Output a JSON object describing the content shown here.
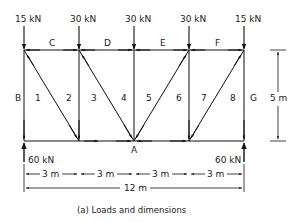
{
  "diagram": {
    "type": "truss-loads-and-dimensions",
    "caption": "(a) Loads and dimensions",
    "applied_loads": [
      {
        "label": "15 kN",
        "position_m": 0
      },
      {
        "label": "30 kN",
        "position_m": 3
      },
      {
        "label": "30 kN",
        "position_m": 6
      },
      {
        "label": "30 kN",
        "position_m": 9
      },
      {
        "label": "15 kN",
        "position_m": 12
      }
    ],
    "reactions": [
      {
        "label": "60 kN",
        "side": "left"
      },
      {
        "label": "60 kN",
        "side": "right"
      }
    ],
    "space_labels": {
      "top": [
        "C",
        "D",
        "E",
        "F"
      ],
      "left": "B",
      "right": "G",
      "bottom": "A",
      "interior": [
        "1",
        "2",
        "3",
        "4",
        "5",
        "6",
        "7",
        "8"
      ]
    },
    "dimensions": {
      "height": "5 m",
      "panels": [
        "3 m",
        "3 m",
        "3 m",
        "3 m"
      ],
      "total_span": "12 m"
    }
  }
}
